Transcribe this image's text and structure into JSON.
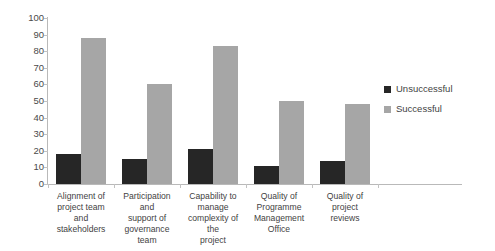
{
  "chart_data": {
    "type": "bar",
    "title": "",
    "subtitle": "",
    "xlabel": "",
    "ylabel": "",
    "ylim": [
      0,
      100
    ],
    "ytick_step": 10,
    "yticks": [
      0,
      10,
      20,
      30,
      40,
      50,
      60,
      70,
      80,
      90,
      100
    ],
    "grid": false,
    "legend_position": "right",
    "categories": [
      "Alignment of project team and stakeholders",
      "Participation and support of governance team",
      "Capability to manage complexity of the project",
      "Quality of Programme Management Office",
      "Quality of project reviews"
    ],
    "series": [
      {
        "name": "Unsuccessful",
        "color": "#262626",
        "values": [
          18,
          15,
          21,
          11,
          14
        ]
      },
      {
        "name": "Successful",
        "color": "#a6a6a6",
        "values": [
          88,
          60,
          83,
          50,
          48
        ]
      }
    ]
  },
  "axis": {
    "y_labels": [
      "100",
      "90",
      "80",
      "70",
      "60",
      "50",
      "40",
      "30",
      "20",
      "10",
      "0"
    ]
  },
  "categories_display": [
    "Alignment of\nproject team and\nstakeholders",
    "Participation and\nsupport of\ngovernance team",
    "Capability to\nmanage\ncomplexity of the\nproject",
    "Quality of\nProgramme\nManagement\nOffice",
    "Quality of project\nreviews"
  ],
  "legend": {
    "items": [
      {
        "label": "Unsuccessful",
        "color": "#262626"
      },
      {
        "label": "Successful",
        "color": "#a6a6a6"
      }
    ]
  }
}
